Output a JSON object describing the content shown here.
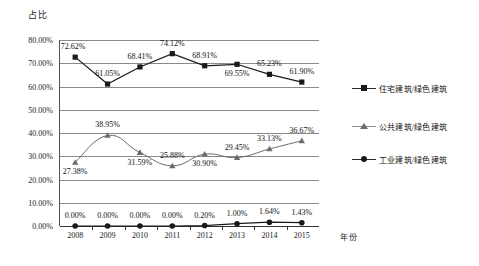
{
  "chart_data": {
    "type": "line",
    "title": "",
    "ylabel": "占比",
    "xlabel": "年份",
    "categories": [
      "2008",
      "2009",
      "2010",
      "2011",
      "2012",
      "2013",
      "2014",
      "2015"
    ],
    "ylim": [
      0,
      80
    ],
    "ytick_labels": [
      "0.00%",
      "10.00%",
      "20.00%",
      "30.00%",
      "40.00%",
      "50.00%",
      "60.00%",
      "70.00%",
      "80.00%"
    ],
    "ytick_values": [
      0,
      10,
      20,
      30,
      40,
      50,
      60,
      70,
      80
    ],
    "grid": true,
    "legend_position": "right",
    "series": [
      {
        "name": "住宅建筑/绿色建筑",
        "marker": "square",
        "color": "#1a1a1a",
        "values": [
          72.62,
          61.05,
          68.41,
          74.12,
          68.91,
          69.55,
          65.23,
          61.9
        ],
        "labels": [
          "72.62%",
          "61.05%",
          "68.41%",
          "74.12%",
          "68.91%",
          "69.55%",
          "65.23%",
          "61.90%"
        ],
        "label_offsets": [
          "above-left",
          "above",
          "above",
          "above",
          "above",
          "below",
          "above",
          "above"
        ]
      },
      {
        "name": "公共建筑/绿色建筑",
        "marker": "triangle",
        "color": "#6b6b6b",
        "values": [
          27.38,
          38.95,
          31.59,
          25.88,
          30.9,
          29.45,
          33.13,
          36.67
        ],
        "labels": [
          "27.38%",
          "38.95%",
          "31.59%",
          "25.88%",
          "30.90%",
          "29.45%",
          "33.13%",
          "36.67%"
        ],
        "label_offsets": [
          "below",
          "above",
          "below",
          "above",
          "below",
          "above",
          "above",
          "above"
        ]
      },
      {
        "name": "工业建筑/绿色建筑",
        "marker": "circle",
        "color": "#1a1a1a",
        "values": [
          0.0,
          0.0,
          0.0,
          0.0,
          0.2,
          1.0,
          1.64,
          1.43
        ],
        "labels": [
          "0.00%",
          "0.00%",
          "0.00%",
          "0.00%",
          "0.20%",
          "1.00%",
          "1.64%",
          "1.43%"
        ],
        "label_offsets": [
          "above",
          "above",
          "above",
          "above",
          "above",
          "above",
          "above",
          "above"
        ]
      }
    ]
  }
}
